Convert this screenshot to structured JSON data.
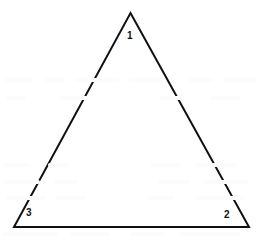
{
  "figure": {
    "type": "geometry-diagram",
    "shape": "triangle",
    "background_color": "#ffffff",
    "stroke_color": "#111111",
    "stroke_width": 2,
    "canvas": {
      "width": 263,
      "height": 244
    }
  },
  "chart_data": {
    "type": "diagram",
    "title": "",
    "shape": "triangle",
    "vertices": [
      {
        "label": "1",
        "x": 130.5,
        "y": 13
      },
      {
        "label": "2",
        "x": 249,
        "y": 227
      },
      {
        "label": "3",
        "x": 14,
        "y": 227
      }
    ],
    "edges": [
      {
        "from": "3",
        "to": "1"
      },
      {
        "from": "1",
        "to": "2"
      },
      {
        "from": "2",
        "to": "3"
      }
    ],
    "vertex_labels": [
      {
        "text": "1",
        "x": 127,
        "y": 31
      },
      {
        "text": "2",
        "x": 224,
        "y": 210
      },
      {
        "text": "3",
        "x": 26,
        "y": 208
      }
    ]
  },
  "labels": {
    "apex": "1",
    "bottom_right": "2",
    "bottom_left": "3"
  },
  "ghosts": [
    {
      "x": 4,
      "y": 78,
      "w": 30
    },
    {
      "x": 44,
      "y": 78,
      "w": 22
    },
    {
      "x": 74,
      "y": 78,
      "w": 46
    },
    {
      "x": 128,
      "y": 78,
      "w": 34
    },
    {
      "x": 188,
      "y": 78,
      "w": 26
    },
    {
      "x": 222,
      "y": 78,
      "w": 36
    },
    {
      "x": 6,
      "y": 96,
      "w": 20
    },
    {
      "x": 60,
      "y": 96,
      "w": 28
    },
    {
      "x": 160,
      "y": 96,
      "w": 24
    },
    {
      "x": 210,
      "y": 96,
      "w": 30
    },
    {
      "x": 4,
      "y": 163,
      "w": 26
    },
    {
      "x": 48,
      "y": 163,
      "w": 20
    },
    {
      "x": 150,
      "y": 163,
      "w": 30
    },
    {
      "x": 196,
      "y": 163,
      "w": 40
    },
    {
      "x": 4,
      "y": 180,
      "w": 36
    },
    {
      "x": 54,
      "y": 180,
      "w": 24
    },
    {
      "x": 158,
      "y": 180,
      "w": 32
    },
    {
      "x": 204,
      "y": 180,
      "w": 44
    },
    {
      "x": 6,
      "y": 196,
      "w": 40
    },
    {
      "x": 56,
      "y": 196,
      "w": 30
    },
    {
      "x": 148,
      "y": 196,
      "w": 26
    },
    {
      "x": 196,
      "y": 196,
      "w": 48
    },
    {
      "x": 2,
      "y": 232,
      "w": 56
    },
    {
      "x": 70,
      "y": 232,
      "w": 40
    },
    {
      "x": 130,
      "y": 232,
      "w": 34
    },
    {
      "x": 180,
      "y": 232,
      "w": 60
    }
  ]
}
